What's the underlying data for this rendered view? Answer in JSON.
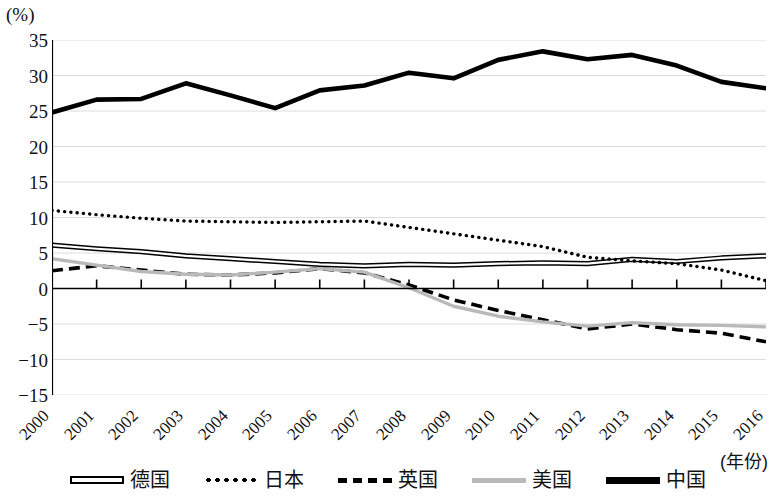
{
  "axis": {
    "unit_label": "(%)",
    "x_axis_title": "(年份)",
    "y_ticks": [
      "35",
      "30",
      "25",
      "20",
      "15",
      "10",
      "5",
      "0",
      "-5",
      "-10",
      "-15"
    ],
    "y_tick_values": [
      35,
      30,
      25,
      20,
      15,
      10,
      5,
      0,
      -5,
      -10,
      -15
    ],
    "x_ticks": [
      "2000",
      "2001",
      "2002",
      "2003",
      "2004",
      "2005",
      "2006",
      "2007",
      "2008",
      "2009",
      "2010",
      "2011",
      "2012",
      "2013",
      "2014",
      "2015",
      "2016"
    ]
  },
  "legend": {
    "position": "bottom-center",
    "items": [
      {
        "label": "德国",
        "style": "double-line",
        "color": "#000000"
      },
      {
        "label": "日本",
        "style": "dotted",
        "color": "#000000"
      },
      {
        "label": "英国",
        "style": "dashed",
        "color": "#000000"
      },
      {
        "label": "美国",
        "style": "solid-gray",
        "color": "#b9b9b9"
      },
      {
        "label": "中国",
        "style": "thick-solid",
        "color": "#000000"
      }
    ]
  },
  "chart_data": {
    "type": "line",
    "title": "",
    "subtitle": "",
    "xlabel": "(年份)",
    "ylabel": "(%)",
    "ylim": [
      -15,
      35
    ],
    "xlim": [
      2000,
      2016
    ],
    "grid": true,
    "x": [
      2000,
      2001,
      2002,
      2003,
      2004,
      2005,
      2006,
      2007,
      2008,
      2009,
      2010,
      2011,
      2012,
      2013,
      2014,
      2015,
      2016
    ],
    "categories": [
      "2000",
      "2001",
      "2002",
      "2003",
      "2004",
      "2005",
      "2006",
      "2007",
      "2008",
      "2009",
      "2010",
      "2011",
      "2012",
      "2013",
      "2014",
      "2015",
      "2016"
    ],
    "series": [
      {
        "name": "德国",
        "style": "double-line",
        "color": "#000000",
        "values": [
          6.1,
          5.6,
          5.2,
          4.6,
          4.2,
          3.8,
          3.4,
          3.2,
          3.4,
          3.3,
          3.5,
          3.6,
          3.5,
          4.1,
          3.8,
          4.3,
          4.6
        ]
      },
      {
        "name": "日本",
        "style": "dotted",
        "color": "#000000",
        "values": [
          11.0,
          10.4,
          9.9,
          9.5,
          9.4,
          9.3,
          9.4,
          9.5,
          8.6,
          7.7,
          6.8,
          5.9,
          4.4,
          3.9,
          3.5,
          2.6,
          1.1
        ]
      },
      {
        "name": "英国",
        "style": "dashed",
        "color": "#000000",
        "values": [
          2.5,
          3.2,
          2.6,
          2.0,
          1.9,
          2.2,
          2.8,
          2.2,
          0.5,
          -1.6,
          -3.1,
          -4.4,
          -5.7,
          -5.0,
          -5.8,
          -6.3,
          -7.5
        ]
      },
      {
        "name": "美国",
        "style": "solid-gray",
        "color": "#b9b9b9",
        "values": [
          4.2,
          3.3,
          2.4,
          2.0,
          1.9,
          2.3,
          2.8,
          2.3,
          0.1,
          -2.5,
          -3.9,
          -4.7,
          -5.3,
          -4.8,
          -5.1,
          -5.2,
          -5.4
        ]
      },
      {
        "name": "中国",
        "style": "thick-solid",
        "color": "#000000",
        "values": [
          24.8,
          26.6,
          26.7,
          28.9,
          27.2,
          25.4,
          27.9,
          28.6,
          30.4,
          29.6,
          32.2,
          33.4,
          32.3,
          32.9,
          31.4,
          29.1,
          28.2
        ]
      }
    ]
  },
  "render": {
    "plot_left": 52,
    "plot_top": 40,
    "plot_width": 714,
    "plot_height": 355
  }
}
